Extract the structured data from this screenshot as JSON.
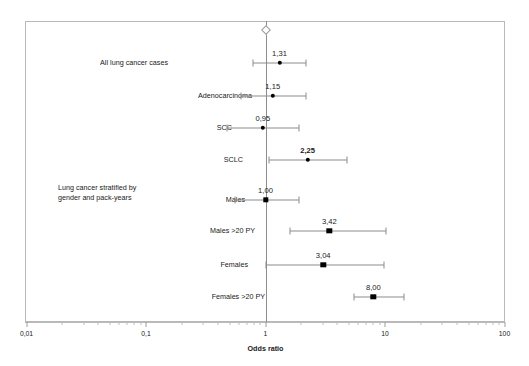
{
  "chart_data": {
    "type": "scatter",
    "title": "",
    "xlabel": "Odds ratio",
    "ylabel": "",
    "xscale": "log",
    "xlim": [
      0.01,
      100
    ],
    "grid": false,
    "legend": null,
    "reference_line": {
      "value": 1,
      "marker": "open-diamond"
    },
    "xticks": [
      {
        "value": 0.01,
        "label": "0,01"
      },
      {
        "value": 0.1,
        "label": "0,1"
      },
      {
        "value": 1,
        "label": "1"
      },
      {
        "value": 10,
        "label": "10"
      },
      {
        "value": 100,
        "label": "100"
      }
    ],
    "group_heading": "Lung cancer stratified by gender and pack-years",
    "rows": [
      {
        "label": "All lung cancer cases",
        "value": 1.31,
        "value_label": "1,31",
        "ci_low": 0.79,
        "ci_high": 2.2,
        "marker": "circle",
        "bold": false
      },
      {
        "label": "Adenocarcinoma",
        "value": 1.15,
        "value_label": "1,15",
        "ci_low": 0.62,
        "ci_high": 2.2,
        "marker": "circle",
        "bold": false
      },
      {
        "label": "SCC",
        "value": 0.95,
        "value_label": "0,95",
        "ci_low": 0.48,
        "ci_high": 1.9,
        "marker": "circle",
        "bold": false
      },
      {
        "label": "SCLC",
        "value": 2.25,
        "value_label": "2,25",
        "ci_low": 1.06,
        "ci_high": 4.8,
        "marker": "circle",
        "bold": true
      },
      {
        "label": "Males",
        "value": 1.0,
        "value_label": "1,00",
        "ci_low": 0.56,
        "ci_high": 1.9,
        "marker": "square",
        "bold": false
      },
      {
        "label": "Males >20 PY",
        "value": 3.42,
        "value_label": "3,42",
        "ci_low": 1.6,
        "ci_high": 10.1,
        "marker": "square",
        "bold": false
      },
      {
        "label": "Females",
        "value": 3.04,
        "value_label": "3,04",
        "ci_low": 1.0,
        "ci_high": 9.8,
        "marker": "square",
        "bold": false
      },
      {
        "label": "Females >20 PY",
        "value": 8.0,
        "value_label": "8,00",
        "ci_low": 5.5,
        "ci_high": 14.5,
        "marker": "square",
        "bold": false
      }
    ]
  }
}
